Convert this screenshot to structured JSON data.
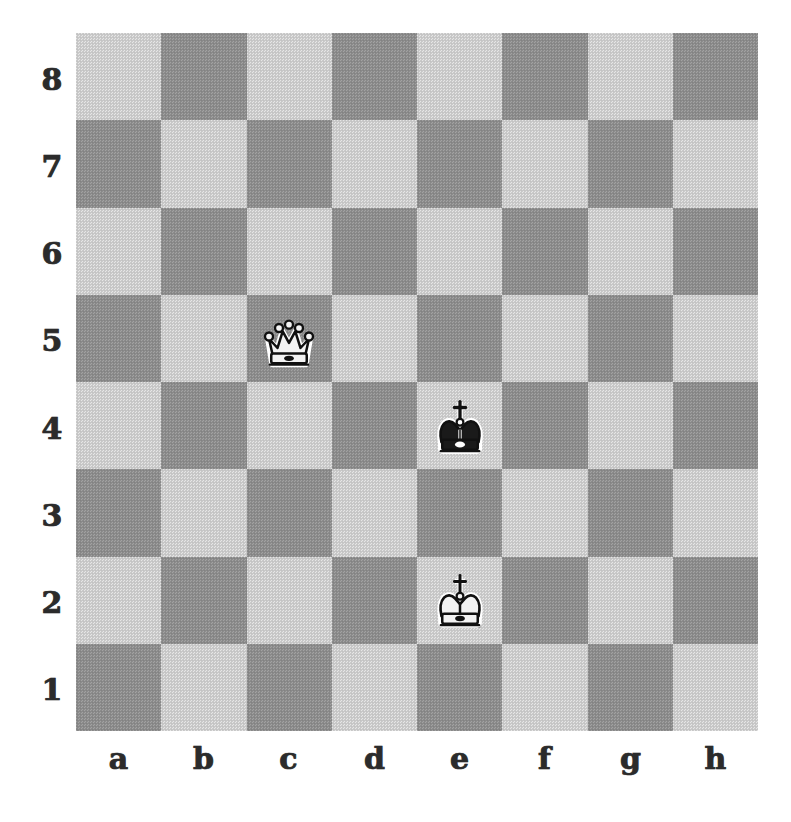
{
  "board": {
    "type": "chessboard",
    "orientation": "white-bottom",
    "files": [
      "a",
      "b",
      "c",
      "d",
      "e",
      "f",
      "g",
      "h"
    ],
    "ranks": [
      "8",
      "7",
      "6",
      "5",
      "4",
      "3",
      "2",
      "1"
    ],
    "colors": {
      "light_square": "#cbcbcb",
      "dark_square": "#8d8d8d",
      "background": "#ffffff",
      "label": "#2b2b2b",
      "piece_white_fill": "#f2f2f2",
      "piece_black_fill": "#1a1a1a",
      "piece_outline": "#111111"
    },
    "squares": [
      {
        "id": "a8",
        "shade": "light"
      },
      {
        "id": "b8",
        "shade": "dark"
      },
      {
        "id": "c8",
        "shade": "light"
      },
      {
        "id": "d8",
        "shade": "dark"
      },
      {
        "id": "e8",
        "shade": "light"
      },
      {
        "id": "f8",
        "shade": "dark"
      },
      {
        "id": "g8",
        "shade": "light"
      },
      {
        "id": "h8",
        "shade": "dark"
      },
      {
        "id": "a7",
        "shade": "dark"
      },
      {
        "id": "b7",
        "shade": "light"
      },
      {
        "id": "c7",
        "shade": "dark"
      },
      {
        "id": "d7",
        "shade": "light"
      },
      {
        "id": "e7",
        "shade": "dark"
      },
      {
        "id": "f7",
        "shade": "light"
      },
      {
        "id": "g7",
        "shade": "dark"
      },
      {
        "id": "h7",
        "shade": "light"
      },
      {
        "id": "a6",
        "shade": "light"
      },
      {
        "id": "b6",
        "shade": "dark"
      },
      {
        "id": "c6",
        "shade": "light"
      },
      {
        "id": "d6",
        "shade": "dark"
      },
      {
        "id": "e6",
        "shade": "light"
      },
      {
        "id": "f6",
        "shade": "dark"
      },
      {
        "id": "g6",
        "shade": "light"
      },
      {
        "id": "h6",
        "shade": "dark"
      },
      {
        "id": "a5",
        "shade": "dark"
      },
      {
        "id": "b5",
        "shade": "light"
      },
      {
        "id": "c5",
        "shade": "dark"
      },
      {
        "id": "d5",
        "shade": "light"
      },
      {
        "id": "e5",
        "shade": "dark"
      },
      {
        "id": "f5",
        "shade": "light"
      },
      {
        "id": "g5",
        "shade": "dark"
      },
      {
        "id": "h5",
        "shade": "light"
      },
      {
        "id": "a4",
        "shade": "light"
      },
      {
        "id": "b4",
        "shade": "dark"
      },
      {
        "id": "c4",
        "shade": "light"
      },
      {
        "id": "d4",
        "shade": "dark"
      },
      {
        "id": "e4",
        "shade": "light"
      },
      {
        "id": "f4",
        "shade": "dark"
      },
      {
        "id": "g4",
        "shade": "light"
      },
      {
        "id": "h4",
        "shade": "dark"
      },
      {
        "id": "a3",
        "shade": "dark"
      },
      {
        "id": "b3",
        "shade": "light"
      },
      {
        "id": "c3",
        "shade": "dark"
      },
      {
        "id": "d3",
        "shade": "light"
      },
      {
        "id": "e3",
        "shade": "dark"
      },
      {
        "id": "f3",
        "shade": "light"
      },
      {
        "id": "g3",
        "shade": "dark"
      },
      {
        "id": "h3",
        "shade": "light"
      },
      {
        "id": "a2",
        "shade": "light"
      },
      {
        "id": "b2",
        "shade": "dark"
      },
      {
        "id": "c2",
        "shade": "light"
      },
      {
        "id": "d2",
        "shade": "dark"
      },
      {
        "id": "e2",
        "shade": "light"
      },
      {
        "id": "f2",
        "shade": "dark"
      },
      {
        "id": "g2",
        "shade": "light"
      },
      {
        "id": "h2",
        "shade": "dark"
      },
      {
        "id": "a1",
        "shade": "dark"
      },
      {
        "id": "b1",
        "shade": "light"
      },
      {
        "id": "c1",
        "shade": "dark"
      },
      {
        "id": "d1",
        "shade": "light"
      },
      {
        "id": "e1",
        "shade": "dark"
      },
      {
        "id": "f1",
        "shade": "light"
      },
      {
        "id": "g1",
        "shade": "dark"
      },
      {
        "id": "h1",
        "shade": "light"
      }
    ],
    "pieces": [
      {
        "square": "c5",
        "color": "white",
        "type": "queen",
        "icon": "white-queen-icon",
        "label": "White queen on c5"
      },
      {
        "square": "e4",
        "color": "black",
        "type": "king",
        "icon": "black-king-icon",
        "label": "Black king on e4"
      },
      {
        "square": "e2",
        "color": "white",
        "type": "king",
        "icon": "white-king-icon",
        "label": "White king on e2"
      }
    ],
    "position_fen": "8/8/8/2Q5/4k3/8/4K3/8",
    "piece_count": 3
  }
}
